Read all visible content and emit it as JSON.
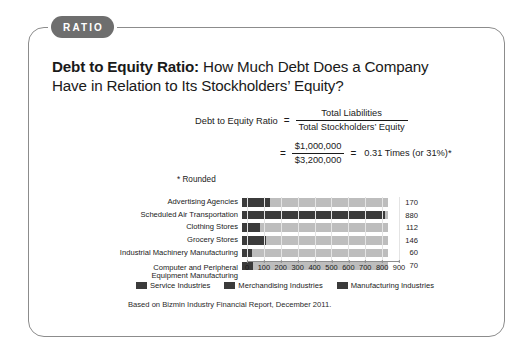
{
  "badge": {
    "label": "RATIO"
  },
  "heading": {
    "lead": "Debt to Equity Ratio:",
    "rest": " How Much Debt Does a Company Have in Relation to Its Stockholders’ Equity?"
  },
  "formula": {
    "label": "Debt to Equity Ratio",
    "equals": "=",
    "numerator": "Total Liabilities",
    "denominator": "Total Stockholders’ Equity",
    "equals2": "=",
    "numerator2": "$1,000,000",
    "denominator2": "$3,200,000",
    "equals3": "=",
    "result": "0.31 Times (or 31%)*",
    "footnote": "* Rounded"
  },
  "chart_data": {
    "type": "bar",
    "orientation": "horizontal",
    "title": "",
    "xlabel": "",
    "ylabel": "",
    "xlim": [
      0,
      900
    ],
    "xticks": [
      0,
      100,
      200,
      300,
      400,
      500,
      600,
      700,
      800,
      900
    ],
    "grid": true,
    "legend_position": "bottom",
    "categories": [
      "Advertising Agencies",
      "Scheduled Air Transportation",
      "Clothing Stores",
      "Grocery Stores",
      "Industrial Machinery Manufacturing",
      "Computer and Peripheral\nEquipment Manufacturing"
    ],
    "values": [
      170,
      880,
      112,
      146,
      60,
      70
    ],
    "value_labels": [
      "170",
      "880",
      "112",
      "146",
      "60",
      "70"
    ],
    "groups": [
      "Service Industries",
      "Service Industries",
      "Merchandising Industries",
      "Merchandising Industries",
      "Manufacturing Industries",
      "Manufacturing Industries"
    ],
    "legend": [
      {
        "label": "Service Industries",
        "color": "#3b3b3b"
      },
      {
        "label": "Merchandising Industries",
        "color": "#3b3b3b"
      },
      {
        "label": "Manufacturing Industries",
        "color": "#3b3b3b"
      }
    ],
    "bar_color": "#3b3b3b",
    "track_color": "#bdbdbd"
  },
  "source": {
    "text": "Based on Bizmin Industry Financial Report, December 2011."
  },
  "colors": {
    "badge_bg": "#6e6e6e",
    "card_border": "#8c8c8c",
    "bar": "#3b3b3b",
    "track": "#bdbdbd"
  }
}
